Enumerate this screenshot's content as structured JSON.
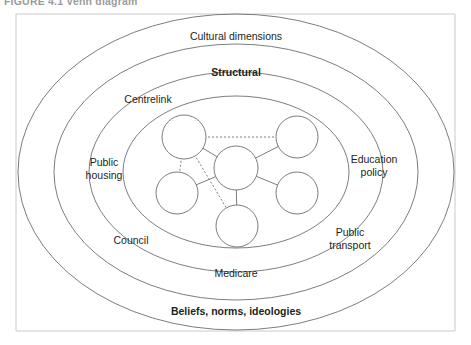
{
  "figure": {
    "caption": "FIGURE 4.1   Venn diagram"
  },
  "rings": [
    {
      "id": "cultural",
      "label": "Cultural dimensions",
      "weight": "bold-false",
      "x": 236,
      "y": 36
    },
    {
      "id": "structural",
      "label": "Structural",
      "weight": "bold",
      "x": 236,
      "y": 72
    },
    {
      "id": "centrelink",
      "label": "Centrelink",
      "weight": "regular",
      "x": 148,
      "y": 99
    },
    {
      "id": "public-housing",
      "label": "Public\nhousing",
      "weight": "regular",
      "x": 104,
      "y": 168
    },
    {
      "id": "council",
      "label": "Council",
      "weight": "regular",
      "x": 131,
      "y": 240
    },
    {
      "id": "medicare",
      "label": "Medicare",
      "weight": "regular",
      "x": 236,
      "y": 273
    },
    {
      "id": "public-transport",
      "label": "Public\ntransport",
      "weight": "regular",
      "x": 350,
      "y": 238
    },
    {
      "id": "education-policy",
      "label": "Education\npolicy",
      "weight": "regular",
      "x": 374,
      "y": 165
    },
    {
      "id": "beliefs",
      "label": "Beliefs, norms, ideologies",
      "weight": "bold",
      "x": 236,
      "y": 311
    }
  ],
  "diagram_data": {
    "type": "venn-network",
    "ellipses": [
      {
        "name": "outer-ellipse",
        "cx": 236,
        "cy": 172,
        "rx": 218,
        "ry": 158
      },
      {
        "name": "second-ellipse",
        "cx": 236,
        "cy": 172,
        "rx": 182,
        "ry": 128
      },
      {
        "name": "third-ellipse",
        "cx": 236,
        "cy": 172,
        "rx": 147,
        "ry": 100
      },
      {
        "name": "inner-ellipse",
        "cx": 236,
        "cy": 172,
        "rx": 113,
        "ry": 76
      }
    ],
    "nodes": [
      {
        "id": "center",
        "cx": 236,
        "cy": 168,
        "r": 22
      },
      {
        "id": "top-left",
        "cx": 184,
        "cy": 137,
        "r": 22
      },
      {
        "id": "top-right",
        "cx": 297,
        "cy": 137,
        "r": 21
      },
      {
        "id": "mid-left",
        "cx": 177,
        "cy": 193,
        "r": 21
      },
      {
        "id": "mid-right",
        "cx": 297,
        "cy": 193,
        "r": 21
      },
      {
        "id": "bottom",
        "cx": 237,
        "cy": 226,
        "r": 21
      }
    ],
    "links": [
      {
        "from": "top-left",
        "to": "top-right",
        "style": "dashed"
      },
      {
        "from": "top-left",
        "to": "center",
        "style": "solid"
      },
      {
        "from": "top-left",
        "to": "mid-left",
        "style": "dashed"
      },
      {
        "from": "top-left",
        "to": "bottom",
        "style": "dashed"
      },
      {
        "from": "center",
        "to": "top-right",
        "style": "solid"
      },
      {
        "from": "center",
        "to": "mid-left",
        "style": "solid"
      },
      {
        "from": "center",
        "to": "mid-right",
        "style": "solid"
      },
      {
        "from": "center",
        "to": "bottom",
        "style": "solid"
      }
    ]
  },
  "colors": {
    "stroke": "#6d6e70",
    "text": "#231f20",
    "frame": "#c9c9c9",
    "background": "#ffffff"
  }
}
